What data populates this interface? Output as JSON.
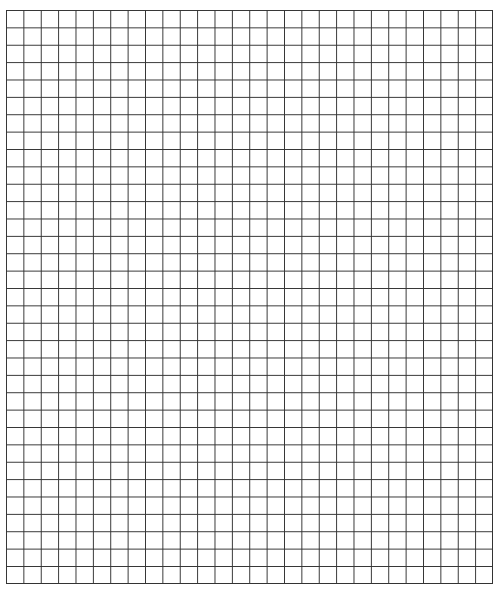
{
  "page": {
    "type": "graph-paper",
    "grid": {
      "columns": 28,
      "rows": 33,
      "line_color": "#333333",
      "background": "#ffffff"
    }
  }
}
